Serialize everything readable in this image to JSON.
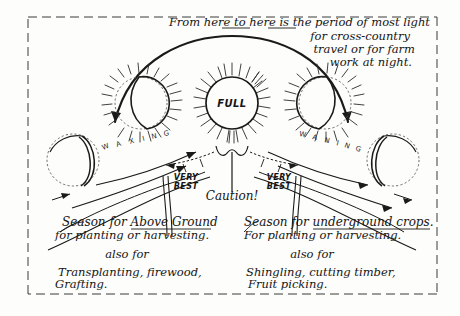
{
  "header": {
    "line1": "From here to here is the period of most light",
    "line2": "for cross-country",
    "line3": "travel or for farm",
    "line4": "work at night.",
    "underlined_words": [
      "here",
      "here"
    ]
  },
  "moons": {
    "center_label": "FULL",
    "phases": [
      {
        "name": "new-moon-left",
        "label": "",
        "type": "crescent-left"
      },
      {
        "name": "first-quarter-moon",
        "label": "",
        "type": "half-right-lit"
      },
      {
        "name": "full-moon",
        "label": "FULL",
        "type": "full"
      },
      {
        "name": "last-quarter-moon",
        "label": "",
        "type": "half-left-lit"
      },
      {
        "name": "new-moon-right",
        "label": "",
        "type": "crescent-right"
      }
    ]
  },
  "arcs": {
    "waxing_label": "WAXING",
    "waxing_letters": [
      "W",
      "A",
      "X",
      "I",
      "N",
      "G"
    ],
    "waning_label": "WANING",
    "waning_letters": [
      "W",
      "A",
      "N",
      "I",
      "N",
      "G"
    ]
  },
  "markers": {
    "very_best_left": "VERY\nBEST",
    "very_best_left_line1": "VERY",
    "very_best_left_line2": "BEST",
    "very_best_right_line1": "VERY",
    "very_best_right_line2": "BEST",
    "caution": "Caution!"
  },
  "left_column": {
    "heading_lead": "Season for ",
    "heading_underlined": "Above Ground",
    "heading_full": "Season for Above Ground",
    "subheading": "for planting or harvesting.",
    "also_for": "also for",
    "detail_line1": "Transplanting, firewood,",
    "detail_line2": "Grafting."
  },
  "right_column": {
    "heading_lead": "Season for ",
    "heading_underlined": "underground crops.",
    "heading_full": "Season for underground crops.",
    "subheading": "For planting or harvesting.",
    "also_for": "also for",
    "detail_line1": "Shingling, cutting timber,",
    "detail_line2": "Fruit picking."
  },
  "colors": {
    "ink": "#1a1a1a",
    "paper": "#fdfdfb",
    "frame": "#3a3a3a",
    "ray": "#2b2b2b"
  }
}
